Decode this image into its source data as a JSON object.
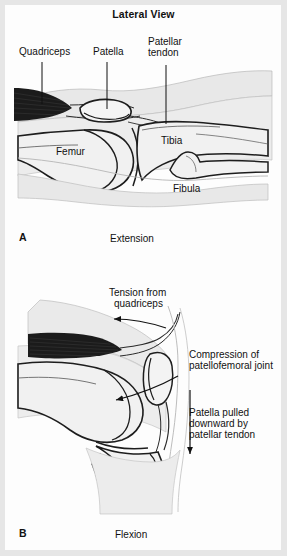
{
  "figure": {
    "title": "Lateral View",
    "background_color": "#fdfdfd",
    "border_color": "#e6e6e6",
    "ink_color": "#111111",
    "muscle_fill": "#1a1a1a",
    "bone_fill": "#f2f2f2",
    "soft_tissue_fill": "#e4e4e4"
  },
  "panels": [
    {
      "id": "A",
      "letter": "A",
      "caption": "Extension",
      "labels": [
        {
          "name": "quadriceps",
          "text": "Quadriceps",
          "x": 19,
          "y": 52
        },
        {
          "name": "patella",
          "text": "Patella",
          "x": 93,
          "y": 52
        },
        {
          "name": "patellar-tendon-line1",
          "text": "Patellar",
          "x": 148,
          "y": 41
        },
        {
          "name": "patellar-tendon-line2",
          "text": "tendon",
          "x": 148,
          "y": 52
        },
        {
          "name": "femur",
          "text": "Femur",
          "x": 56,
          "y": 152
        },
        {
          "name": "tibia",
          "text": "Tibia",
          "x": 161,
          "y": 141
        },
        {
          "name": "fibula",
          "text": "Fibula",
          "x": 173,
          "y": 188
        }
      ],
      "leader_lines": [
        {
          "name": "leader-quadriceps",
          "x1": 42,
          "y1": 62,
          "x2": 42,
          "y2": 104
        },
        {
          "name": "leader-patella",
          "x1": 107,
          "y1": 62,
          "x2": 107,
          "y2": 110
        },
        {
          "name": "leader-patellar-tendon",
          "x1": 166,
          "y1": 63,
          "x2": 166,
          "y2": 123
        }
      ]
    },
    {
      "id": "B",
      "letter": "B",
      "caption": "Flexion",
      "labels": [
        {
          "name": "tension-line1",
          "text": "Tension from",
          "x": 109,
          "y": 292
        },
        {
          "name": "tension-line2",
          "text": "quadriceps",
          "x": 114,
          "y": 303
        },
        {
          "name": "compression-line1",
          "text": "Compression of",
          "x": 189,
          "y": 354
        },
        {
          "name": "compression-line2",
          "text": "patellofemoral joint",
          "x": 189,
          "y": 365
        },
        {
          "name": "patella-pulled-line1",
          "text": "Patella pulled",
          "x": 189,
          "y": 412
        },
        {
          "name": "patella-pulled-line2",
          "text": "downward by",
          "x": 189,
          "y": 423
        },
        {
          "name": "patella-pulled-line3",
          "text": "patellar tendon",
          "x": 189,
          "y": 434
        }
      ],
      "arrows": [
        {
          "name": "arrow-tension-from-quadriceps",
          "direction": "left"
        },
        {
          "name": "arrow-compression-patellofemoral",
          "direction": "down-left"
        },
        {
          "name": "arrow-patella-pulled-downward",
          "direction": "down"
        }
      ]
    }
  ],
  "captions": {
    "panel_a_letter_x": 19,
    "panel_a_letter_y": 234,
    "panel_a_caption_x": 110,
    "panel_a_caption_y": 235,
    "panel_b_letter_x": 19,
    "panel_b_letter_y": 530,
    "panel_b_caption_x": 115,
    "panel_b_caption_y": 531
  }
}
